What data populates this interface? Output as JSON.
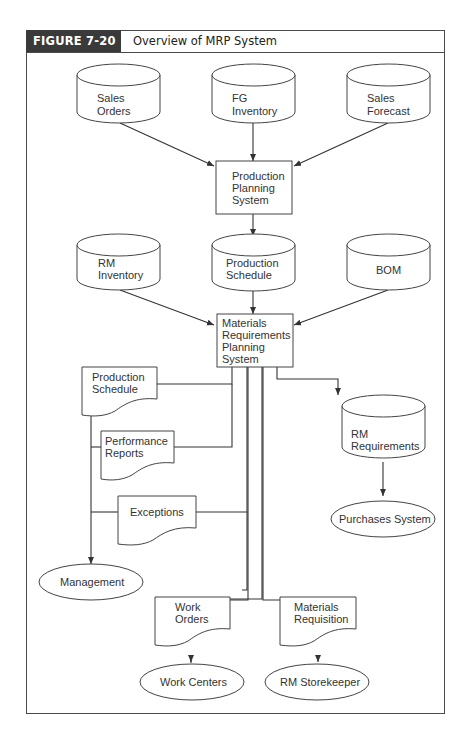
{
  "figure": {
    "label": "FIGURE 7-20",
    "title": "Overview of MRP System",
    "label_bg": "#3a3a3a",
    "line_color": "#333333"
  },
  "nodes": {
    "sales_orders": {
      "type": "data-store",
      "lines": [
        "Sales",
        "Orders"
      ]
    },
    "fg_inventory": {
      "type": "data-store",
      "lines": [
        "FG",
        "Inventory"
      ]
    },
    "sales_forecast": {
      "type": "data-store",
      "lines": [
        "Sales",
        "Forecast"
      ]
    },
    "production_planning": {
      "type": "process",
      "lines": [
        "Production",
        "Planning",
        "System"
      ]
    },
    "rm_inventory": {
      "type": "data-store",
      "lines": [
        "RM",
        "Inventory"
      ]
    },
    "production_schedule_store": {
      "type": "data-store",
      "lines": [
        "Production",
        "Schedule"
      ]
    },
    "bom": {
      "type": "data-store",
      "lines": [
        "BOM"
      ]
    },
    "mrp": {
      "type": "process",
      "lines": [
        "Materials",
        "Requirements",
        "Planning",
        "System"
      ]
    },
    "production_schedule_doc": {
      "type": "document",
      "lines": [
        "Production",
        "Schedule"
      ]
    },
    "performance_reports": {
      "type": "document",
      "lines": [
        "Performance",
        "Reports"
      ]
    },
    "exceptions": {
      "type": "document",
      "lines": [
        "Exceptions"
      ]
    },
    "management": {
      "type": "entity",
      "lines": [
        "Management"
      ]
    },
    "rm_requirements": {
      "type": "data-store",
      "lines": [
        "RM",
        "Requirements"
      ]
    },
    "purchases_system": {
      "type": "entity",
      "lines": [
        "Purchases System"
      ]
    },
    "work_orders": {
      "type": "document",
      "lines": [
        "Work",
        "Orders"
      ]
    },
    "materials_requisition": {
      "type": "document",
      "lines": [
        "Materials",
        "Requisition"
      ]
    },
    "work_centers": {
      "type": "entity",
      "lines": [
        "Work Centers"
      ]
    },
    "rm_storekeeper": {
      "type": "entity",
      "lines": [
        "RM Storekeeper"
      ]
    }
  },
  "edges": [
    {
      "from": "Sales Orders",
      "to": "Production Planning System"
    },
    {
      "from": "FG Inventory",
      "to": "Production Planning System"
    },
    {
      "from": "Sales Forecast",
      "to": "Production Planning System"
    },
    {
      "from": "Production Planning System",
      "to": "Production Schedule"
    },
    {
      "from": "RM Inventory",
      "to": "Materials Requirements Planning System"
    },
    {
      "from": "Production Schedule",
      "to": "Materials Requirements Planning System"
    },
    {
      "from": "BOM",
      "to": "Materials Requirements Planning System"
    },
    {
      "from": "Materials Requirements Planning System",
      "to": "Production Schedule (report)"
    },
    {
      "from": "Materials Requirements Planning System",
      "to": "Performance Reports"
    },
    {
      "from": "Materials Requirements Planning System",
      "to": "Exceptions"
    },
    {
      "from": "Production Schedule (report)",
      "to": "Management"
    },
    {
      "from": "Performance Reports",
      "to": "Management"
    },
    {
      "from": "Exceptions",
      "to": "Management"
    },
    {
      "from": "Materials Requirements Planning System",
      "to": "RM Requirements"
    },
    {
      "from": "RM Requirements",
      "to": "Purchases System"
    },
    {
      "from": "Materials Requirements Planning System",
      "to": "Work Orders"
    },
    {
      "from": "Materials Requirements Planning System",
      "to": "Materials Requisition"
    },
    {
      "from": "Work Orders",
      "to": "Work Centers"
    },
    {
      "from": "Materials Requisition",
      "to": "RM Storekeeper"
    }
  ]
}
